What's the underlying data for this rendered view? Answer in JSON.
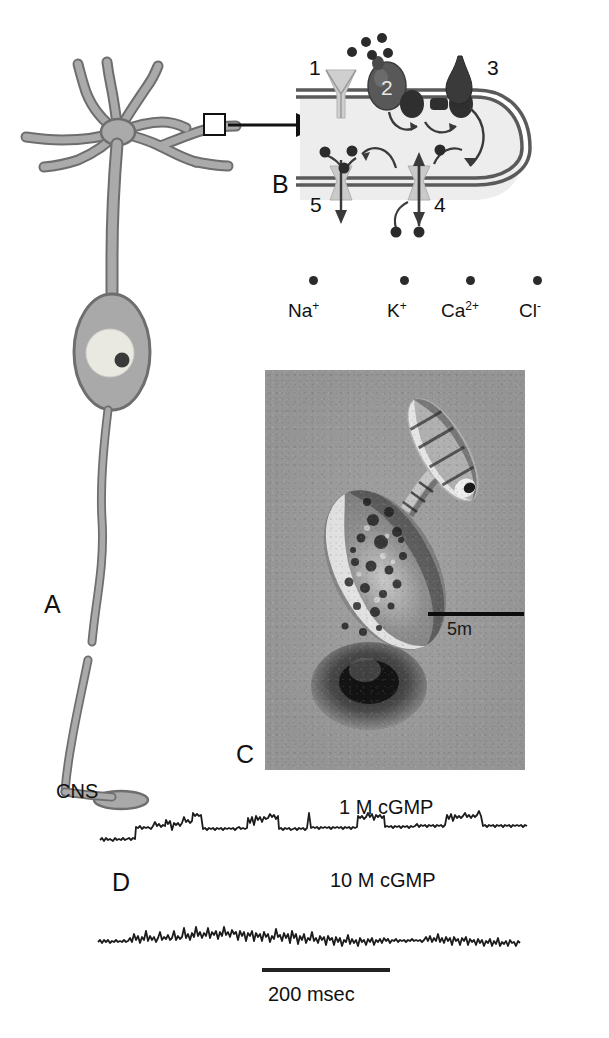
{
  "figure": {
    "panels": {
      "a": {
        "letter": "A",
        "cns_label": "CNS"
      },
      "b": {
        "letter": "B"
      },
      "c": {
        "letter": "C",
        "scale_label": "5m"
      },
      "d": {
        "letter": "D"
      }
    },
    "panel_b": {
      "numbers": [
        "1",
        "2",
        "3",
        "4",
        "5"
      ],
      "ion_legend": [
        {
          "name": "Na",
          "charge": "+"
        },
        {
          "name": "K",
          "charge": "+"
        },
        {
          "name": "Ca",
          "charge": "2+"
        },
        {
          "name": "Cl",
          "charge": "-"
        }
      ]
    },
    "traces": [
      {
        "label": "1 M cGMP"
      },
      {
        "label": "10 M cGMP"
      }
    ],
    "time_scale": {
      "label": "200 msec"
    },
    "colors": {
      "neuron_fill": "#a9a9a9",
      "neuron_stroke": "#6e6e6e",
      "nucleus_fill": "#e9e9e1",
      "nucleolus_fill": "#3a3a3a",
      "membrane_line": "#5a5a5a",
      "cytoplasm": "#ededed",
      "protein_dark": "#4a4a4a",
      "protein_mid": "#6b6b6b",
      "channel_fill": "#c9c9c9",
      "ion_dot": "#2b2b2b",
      "trace_ink": "#1c1c1c",
      "micrograph_bg": "#9a9a9a"
    }
  }
}
